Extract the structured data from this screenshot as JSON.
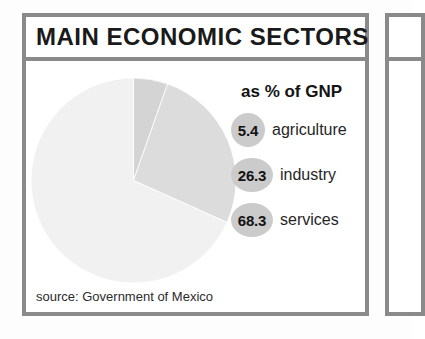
{
  "panel": {
    "title": "MAIN ECONOMIC SECTORS",
    "source": "source: Government of Mexico"
  },
  "legend": {
    "heading": "as % of GNP",
    "bubble_color": "#cbcbcb"
  },
  "colors": {
    "frame": "#8a8a8a",
    "background": "#ffffff",
    "text": "#1a1a1a"
  },
  "chart_data": {
    "type": "pie",
    "title": "MAIN ECONOMIC SECTORS",
    "subtitle": "as % of GNP",
    "unit": "% of GNP",
    "source": "source: Government of Mexico",
    "start_angle": 0,
    "direction": "clockwise",
    "legend_position": "right",
    "grid": false,
    "categories": [
      "agriculture",
      "industry",
      "services"
    ],
    "values": [
      5.4,
      26.3,
      68.3
    ],
    "value_labels": [
      "5.4",
      "26.3",
      "68.3"
    ],
    "slice_colors": [
      "#d4d4d4",
      "#dcdcdc",
      "#f1f1f1"
    ],
    "slices": [
      {
        "label": "agriculture",
        "value": 5.4,
        "display": "5.4",
        "color": "#d4d4d4"
      },
      {
        "label": "industry",
        "value": 26.3,
        "display": "26.3",
        "color": "#dcdcdc"
      },
      {
        "label": "services",
        "value": 68.3,
        "display": "68.3",
        "color": "#f1f1f1"
      }
    ]
  }
}
